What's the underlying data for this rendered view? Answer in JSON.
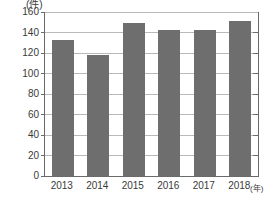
{
  "chart_data": {
    "type": "bar",
    "title": "",
    "subtitle": "",
    "xlabel": "(年)",
    "ylabel": "(件)",
    "categories": [
      "2013",
      "2014",
      "2015",
      "2016",
      "2017",
      "2018"
    ],
    "values": [
      133,
      118,
      149,
      142,
      142,
      151
    ],
    "series": [
      {
        "name": "件数",
        "values": [
          133,
          118,
          149,
          142,
          142,
          151
        ]
      }
    ],
    "ylim": [
      0,
      160
    ],
    "xlim": [
      0,
      6
    ],
    "y_ticks": [
      0,
      20,
      40,
      60,
      80,
      100,
      120,
      140,
      160
    ],
    "y_tick_labels": [
      "0",
      "20",
      "40",
      "60",
      "80",
      "100",
      "120",
      "140",
      "160"
    ],
    "x_tick_labels": [
      "2013",
      "2014",
      "2015",
      "2016",
      "2017",
      "2018"
    ],
    "grid": true,
    "grid_axis": "y",
    "legend": false,
    "legend_position": "none",
    "annotations": [],
    "colors": {
      "bar": "#6e6e6e",
      "axis": "#6a6a6a",
      "gridline": "#b9b9b9",
      "text": "#3a3a3a",
      "background": "#ffffff"
    }
  }
}
